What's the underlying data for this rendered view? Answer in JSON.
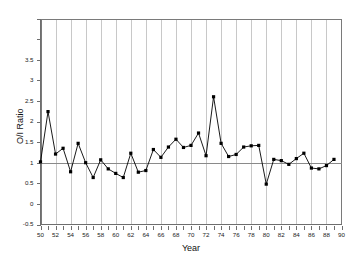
{
  "chart_data": {
    "type": "line",
    "title": "",
    "xlabel": "Year",
    "ylabel": "O/I Ratio",
    "xlim": [
      50,
      90
    ],
    "ylim": [
      -0.5,
      4.5
    ],
    "grid": "vertical gridlines every 2 years",
    "legend": "none",
    "reference_line": {
      "y": 1,
      "label": ""
    },
    "x_tick_labels": [
      "50",
      "52",
      "54",
      "56",
      "58",
      "60",
      "62",
      "64",
      "66",
      "68",
      "70",
      "72",
      "74",
      "76",
      "78",
      "80",
      "82",
      "84",
      "86",
      "88",
      "90"
    ],
    "y_tick_labels": [
      "-0.5",
      "0",
      "0.5",
      "1",
      "1.5",
      "2",
      "2.5",
      "3",
      "3.5",
      "",
      ""
    ],
    "y_ticks": [
      -0.5,
      0,
      0.5,
      1,
      1.5,
      2,
      2.5,
      3,
      3.5,
      4,
      4.5
    ],
    "x": [
      50,
      51,
      52,
      53,
      54,
      55,
      56,
      57,
      58,
      59,
      60,
      61,
      62,
      63,
      64,
      65,
      66,
      67,
      68,
      69,
      70,
      71,
      72,
      73,
      74,
      75,
      76,
      77,
      78,
      79,
      80,
      81,
      82,
      83,
      84,
      85,
      86,
      87,
      88,
      89
    ],
    "values": [
      1.02,
      2.24,
      1.21,
      1.35,
      0.78,
      1.47,
      1.0,
      0.64,
      1.07,
      0.85,
      0.74,
      0.64,
      1.23,
      0.77,
      0.81,
      1.32,
      1.13,
      1.38,
      1.57,
      1.37,
      1.42,
      1.72,
      1.17,
      2.6,
      1.47,
      1.15,
      1.2,
      1.38,
      1.41,
      1.42,
      0.48,
      1.08,
      1.05,
      0.96,
      1.1,
      1.23,
      0.87,
      0.85,
      0.93,
      1.08
    ],
    "series": [
      {
        "name": "O/I Ratio",
        "marker": "filled-square",
        "color": "#000000",
        "values": [
          1.02,
          2.24,
          1.21,
          1.35,
          0.78,
          1.47,
          1.0,
          0.64,
          1.07,
          0.85,
          0.74,
          0.64,
          1.23,
          0.77,
          0.81,
          1.32,
          1.13,
          1.38,
          1.57,
          1.37,
          1.42,
          1.72,
          1.17,
          2.6,
          1.47,
          1.15,
          1.2,
          1.38,
          1.41,
          1.42,
          0.48,
          1.08,
          1.05,
          0.96,
          1.1,
          1.23,
          0.87,
          0.85,
          0.93,
          1.08
        ]
      }
    ]
  },
  "axes": {
    "y_title": "O/I Ratio",
    "x_title": "Year"
  }
}
